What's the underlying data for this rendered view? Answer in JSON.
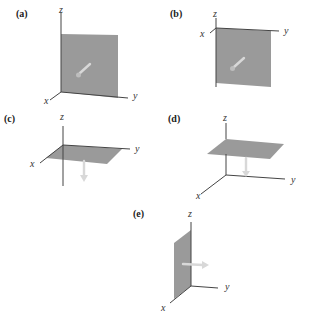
{
  "figure": {
    "colors": {
      "plane_fill": "#9a9a9a",
      "axis_stroke": "#444444",
      "arrow": "#d8d8d8"
    },
    "panels": [
      {
        "id": "a",
        "label": "(a)",
        "axes": {
          "x": "x",
          "y": "y",
          "z": "z"
        },
        "plane": "yz-plane",
        "normal_arrow": "along +x (out of page)"
      },
      {
        "id": "b",
        "label": "(b)",
        "axes": {
          "x": "x",
          "y": "y",
          "z": "z"
        },
        "plane": "yz-plane (hanging below y-axis)",
        "normal_arrow": "along +x (out of page)"
      },
      {
        "id": "c",
        "label": "(c)",
        "axes": {
          "x": "x",
          "y": "y",
          "z": "z"
        },
        "plane": "xy-plane",
        "normal_arrow": "along -z (down)"
      },
      {
        "id": "d",
        "label": "(d)",
        "axes": {
          "x": "x",
          "y": "y",
          "z": "z"
        },
        "plane": "horizontal plane above xy-plane",
        "normal_arrow": "along -z (down)"
      },
      {
        "id": "e",
        "label": "(e)",
        "axes": {
          "x": "x",
          "y": "y",
          "z": "z"
        },
        "plane": "xz-plane",
        "normal_arrow": "along +y"
      }
    ]
  }
}
